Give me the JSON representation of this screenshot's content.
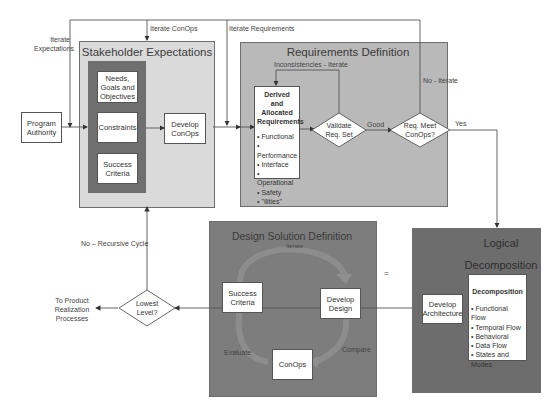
{
  "program_authority": "Program Authority",
  "feedback_labels": {
    "iterate_expectations": "Iterate Expectations",
    "iterate_conops": "Iterate ConOps",
    "iterate_requirements": "Iterate Requirements",
    "no_recursive_cycle": "No – Recursive Cycle"
  },
  "stakeholder": {
    "title": "Stakeholder Expectations",
    "needs": "Needs, Goals and Objectives",
    "constraints": "Constraints",
    "success": "Success Criteria",
    "develop_conops": "Develop ConOps"
  },
  "requirements": {
    "title": "Requirements Definition",
    "inconsistencies": "Inconsistencies - Iterate",
    "derived_title": "Derived and Allocated Requirements",
    "derived_items": [
      "Functional",
      "Performance",
      "Interface",
      "Operational",
      "Safety",
      "\"ilities\""
    ],
    "validate": "Validate Req. Set",
    "good": "Good",
    "req_meet": "Req. Meet ConOps?",
    "no_iterate": "No - Iterate",
    "yes": "Yes"
  },
  "logical": {
    "title": "Logical Decomposition",
    "develop_architecture": "Develop Architecture",
    "decomp_title": "Decomposition",
    "decomp_items": [
      "Functional Flow",
      "Temporal Flow",
      "Behavioral",
      "Data Flow",
      "States and Modes"
    ]
  },
  "design": {
    "title": "Design Solution Definition",
    "iterate": "Iterate",
    "success": "Success Criteria",
    "develop_design": "Develop Design",
    "conops": "ConOps",
    "evaluate": "Evaluate",
    "compare": "Compare"
  },
  "lowest": {
    "question": "Lowest Level?",
    "to_product": "To Product Realization Processes"
  },
  "marker": "="
}
